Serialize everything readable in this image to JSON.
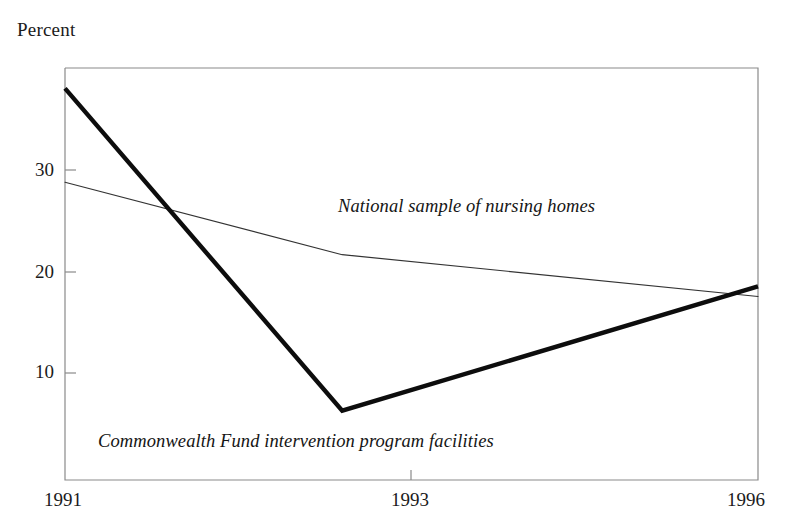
{
  "figure": {
    "axis_title": "Percent",
    "background": "#ffffff",
    "frame_color": "#808080"
  },
  "chart_data": {
    "type": "line",
    "title": "",
    "subtitle": "",
    "xlabel": "",
    "ylabel": "Percent",
    "x": [
      1991,
      1993,
      1996
    ],
    "xlim": [
      1991,
      1996
    ],
    "ylim": [
      0,
      38.5
    ],
    "xticks": [
      1991,
      1993,
      1996
    ],
    "xtick_labels": [
      "1991",
      "1993",
      "1996"
    ],
    "yticks": [
      10,
      20,
      30
    ],
    "ytick_labels": [
      "10",
      "20",
      "30"
    ],
    "grid": false,
    "legend": "inline-annotations",
    "series": [
      {
        "name": "National sample of nursing homes",
        "label": "National sample of nursing homes",
        "values": [
          28.8,
          21.7,
          17.6
        ],
        "color": "#333333",
        "line_width": 1.1,
        "style": "thin"
      },
      {
        "name": "Commonwealth Fund intervention program facilities",
        "label": "Commonwealth Fund intervention program facilities",
        "values": [
          38.0,
          6.4,
          18.6
        ],
        "color": "#0d0d0d",
        "line_width": 4.4,
        "style": "thick"
      }
    ]
  },
  "annotations": {
    "national": "National sample of nursing homes",
    "commonwealth": "Commonwealth Fund intervention program facilities"
  },
  "ytick_labels": [
    "30",
    "20",
    "10"
  ],
  "xtick_labels": [
    "1991",
    "1993",
    "1996"
  ]
}
